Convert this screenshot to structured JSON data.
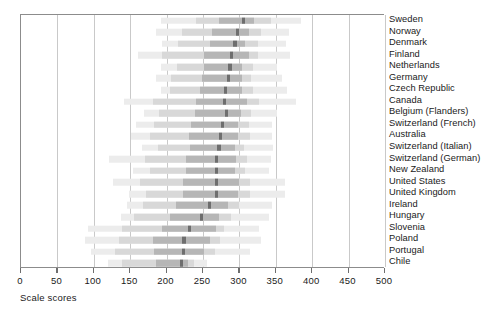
{
  "chart_data": {
    "type": "bar",
    "title": "",
    "subtitle": "",
    "xlabel": "Scale scores",
    "ylabel": "",
    "xlim": [
      0,
      500
    ],
    "ylim": [
      0,
      22
    ],
    "grid": true,
    "legend": false,
    "legend_position": "none",
    "xticks": [
      0,
      50,
      100,
      150,
      200,
      250,
      300,
      350,
      400,
      450,
      500
    ],
    "xticklabels": [
      "0",
      "50",
      "100",
      "150",
      "200",
      "250",
      "300",
      "350",
      "400",
      "450",
      "500"
    ],
    "categories": [
      "Sweden",
      "Norway",
      "Denmark",
      "Finland",
      "Netherlands",
      "Germany",
      "Czech Republic",
      "Canada",
      "Belgium (Flanders)",
      "Switzerland (French)",
      "Australia",
      "Switzerland (Italian)",
      "Switzerland (German)",
      "New Zealand",
      "United States",
      "United Kingdom",
      "Ireland",
      "Hungary",
      "Slovenia",
      "Poland",
      "Portugal",
      "Chile"
    ],
    "series": [
      {
        "name": "5th-95th percentile",
        "band": "outer"
      },
      {
        "name": "25th-75th percentile",
        "band": "mid"
      },
      {
        "name": "interquartile core",
        "band": "inner"
      },
      {
        "name": "mean",
        "band": "median"
      }
    ],
    "rows": [
      {
        "category": "Sweden",
        "p5": 192,
        "p95": 385,
        "p25": 241,
        "p75": 344,
        "lo": 272,
        "hi": 320,
        "mean": 306
      },
      {
        "category": "Norway",
        "p5": 185,
        "p95": 368,
        "p25": 221,
        "p75": 330,
        "lo": 262,
        "hi": 313,
        "mean": 297
      },
      {
        "category": "Denmark",
        "p5": 194,
        "p95": 364,
        "p25": 215,
        "p75": 325,
        "lo": 259,
        "hi": 308,
        "mean": 294
      },
      {
        "category": "Finland",
        "p5": 161,
        "p95": 369,
        "p25": 194,
        "p75": 326,
        "lo": 252,
        "hi": 313,
        "mean": 289
      },
      {
        "category": "Netherlands",
        "p5": 192,
        "p95": 352,
        "p25": 214,
        "p75": 319,
        "lo": 252,
        "hi": 304,
        "mean": 287
      },
      {
        "category": "Germany",
        "p5": 186,
        "p95": 358,
        "p25": 206,
        "p75": 316,
        "lo": 248,
        "hi": 303,
        "mean": 285
      },
      {
        "category": "Czech Republic",
        "p5": 192,
        "p95": 366,
        "p25": 205,
        "p75": 319,
        "lo": 246,
        "hi": 303,
        "mean": 281
      },
      {
        "category": "Canada",
        "p5": 141,
        "p95": 378,
        "p25": 182,
        "p75": 327,
        "lo": 240,
        "hi": 311,
        "mean": 279
      },
      {
        "category": "Belgium (Flanders)",
        "p5": 169,
        "p95": 352,
        "p25": 189,
        "p75": 316,
        "lo": 239,
        "hi": 302,
        "mean": 282
      },
      {
        "category": "Switzerland (French)",
        "p5": 158,
        "p95": 345,
        "p25": 183,
        "p75": 313,
        "lo": 233,
        "hi": 298,
        "mean": 277
      },
      {
        "category": "Australia",
        "p5": 151,
        "p95": 345,
        "p25": 177,
        "p75": 314,
        "lo": 231,
        "hi": 298,
        "mean": 274
      },
      {
        "category": "Switzerland (Italian)",
        "p5": 166,
        "p95": 346,
        "p25": 188,
        "p75": 307,
        "lo": 232,
        "hi": 294,
        "mean": 272
      },
      {
        "category": "Switzerland (German)",
        "p5": 121,
        "p95": 343,
        "p25": 170,
        "p75": 310,
        "lo": 227,
        "hi": 296,
        "mean": 269
      },
      {
        "category": "New Zealand",
        "p5": 154,
        "p95": 341,
        "p25": 177,
        "p75": 308,
        "lo": 226,
        "hi": 294,
        "mean": 269
      },
      {
        "category": "United States",
        "p5": 127,
        "p95": 363,
        "p25": 164,
        "p75": 314,
        "lo": 222,
        "hi": 299,
        "mean": 268
      },
      {
        "category": "United Kingdom",
        "p5": 149,
        "p95": 362,
        "p25": 172,
        "p75": 314,
        "lo": 223,
        "hi": 298,
        "mean": 268
      },
      {
        "category": "Ireland",
        "p5": 146,
        "p95": 345,
        "p25": 168,
        "p75": 299,
        "lo": 213,
        "hi": 284,
        "mean": 259
      },
      {
        "category": "Hungary",
        "p5": 137,
        "p95": 340,
        "p25": 155,
        "p75": 289,
        "lo": 205,
        "hi": 272,
        "mean": 248
      },
      {
        "category": "Slovenia",
        "p5": 92,
        "p95": 327,
        "p25": 139,
        "p75": 279,
        "lo": 194,
        "hi": 268,
        "mean": 232
      },
      {
        "category": "Poland",
        "p5": 88,
        "p95": 329,
        "p25": 134,
        "p75": 273,
        "lo": 182,
        "hi": 259,
        "mean": 224
      },
      {
        "category": "Portugal",
        "p5": 96,
        "p95": 314,
        "p25": 129,
        "p75": 267,
        "lo": 183,
        "hi": 252,
        "mean": 223
      },
      {
        "category": "Chile",
        "p5": 120,
        "p95": 255,
        "p25": 139,
        "p75": 238,
        "lo": 186,
        "hi": 229,
        "mean": 221
      }
    ],
    "colors": {
      "outer": "#ececec",
      "mid": "#d8d8d8",
      "inner": "#b6b6b6",
      "median": "#6e6e6e",
      "axis": "#8c8c8c",
      "grid": "#c9c9c9",
      "text": "#1a1a1a"
    }
  }
}
